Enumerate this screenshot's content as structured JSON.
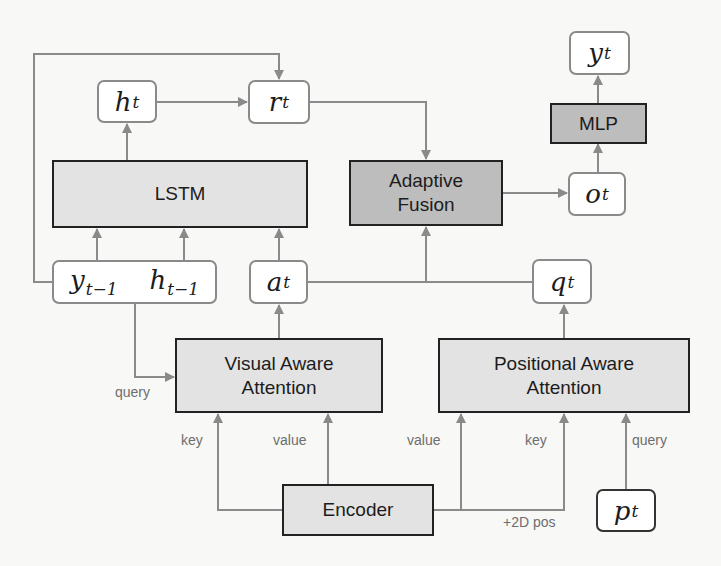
{
  "diagram": {
    "type": "architecture",
    "nodes": {
      "h_t": {
        "base": "h",
        "sub": "t"
      },
      "r_t": {
        "base": "r",
        "sub": "t"
      },
      "y_t": {
        "base": "y",
        "sub": "t"
      },
      "o_t": {
        "base": "o",
        "sub": "t"
      },
      "a_t": {
        "base": "a",
        "sub": "t"
      },
      "q_t": {
        "base": "q",
        "sub": "t"
      },
      "p_t": {
        "base": "p",
        "sub": "t"
      },
      "y_prev": {
        "base": "y",
        "sub": "t−1"
      },
      "h_prev": {
        "base": "h",
        "sub": "t−1"
      }
    },
    "blocks": {
      "lstm": "LSTM",
      "adaptive_fusion_line1": "Adaptive",
      "adaptive_fusion_line2": "Fusion",
      "mlp": "MLP",
      "visual_attention_line1": "Visual Aware",
      "visual_attention_line2": "Attention",
      "positional_attention_line1": "Positional Aware",
      "positional_attention_line2": "Attention",
      "encoder": "Encoder"
    },
    "edge_labels": {
      "visual_query": "query",
      "visual_key": "key",
      "visual_value": "value",
      "positional_value": "value",
      "positional_key": "key",
      "positional_query": "query",
      "pos_encoding": "+2D pos"
    },
    "colors": {
      "wire": "#8a8a8a",
      "block_fill": "#e3e3e3",
      "block_dark_fill": "#bdbdbd",
      "block_border": "#222222",
      "var_border": "#8a8a8a"
    }
  }
}
